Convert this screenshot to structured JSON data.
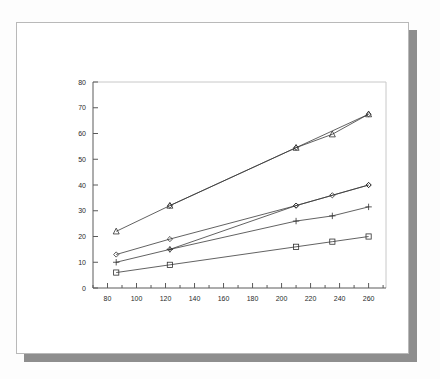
{
  "document": {
    "kind": "scanned-page-figure",
    "page_background": "#ffffff",
    "shadow_color": "#8e8e8e",
    "border_color": "#b9b9b9"
  },
  "chart_data": {
    "type": "line",
    "title": "",
    "subtitle": "",
    "xlabel": "",
    "ylabel": "",
    "xlim": [
      70,
      272
    ],
    "ylim": [
      0,
      80
    ],
    "xticks": [
      80,
      100,
      120,
      140,
      160,
      180,
      200,
      220,
      240,
      260
    ],
    "yticks": [
      0,
      10,
      20,
      30,
      40,
      50,
      60,
      70,
      80
    ],
    "xtick_labels": [
      "80",
      "100",
      "120",
      "140",
      "160",
      "180",
      "200",
      "220",
      "240",
      "260"
    ],
    "ytick_labels": [
      "0",
      "10",
      "20",
      "30",
      "40",
      "50",
      "60",
      "70",
      "80"
    ],
    "grid": false,
    "legend": "none",
    "line_color": "#3a3a3a",
    "marker_color": "#2f2f2f",
    "series": [
      {
        "name": "series-1",
        "marker": "triangle",
        "x": [
          86,
          123,
          210,
          235,
          260
        ],
        "values": [
          22,
          32,
          54.5,
          59.7,
          67.5
        ]
      },
      {
        "name": "series-2",
        "marker": "diamond",
        "x": [
          123,
          210,
          260
        ],
        "values": [
          32,
          54.5,
          67.5
        ]
      },
      {
        "name": "series-3",
        "marker": "diamond",
        "x": [
          86,
          123,
          210,
          260
        ],
        "values": [
          13,
          19,
          32,
          40
        ]
      },
      {
        "name": "series-4",
        "marker": "plus",
        "x": [
          86,
          123,
          210,
          235,
          260
        ],
        "values": [
          10,
          15,
          26,
          28,
          31.5
        ]
      },
      {
        "name": "series-5",
        "marker": "diamond",
        "x": [
          123,
          210,
          235,
          260
        ],
        "values": [
          15,
          32,
          36,
          40
        ]
      },
      {
        "name": "series-6",
        "marker": "square",
        "x": [
          86,
          123,
          210,
          235,
          260
        ],
        "values": [
          6,
          9,
          16,
          18,
          20
        ]
      }
    ]
  }
}
